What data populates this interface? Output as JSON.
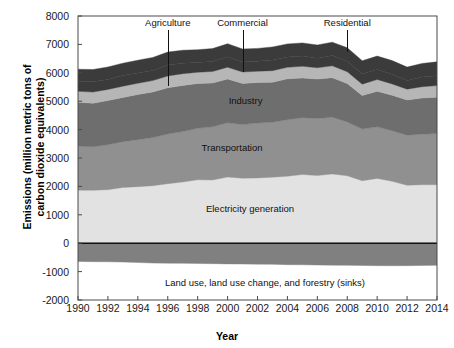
{
  "chart_data": {
    "type": "area",
    "stacked": true,
    "title": "",
    "xlabel": "Year",
    "ylabel": "Emissions (million metric tons of\ncarbon dioxide equivalents)",
    "xlim": [
      1990,
      2014
    ],
    "ylim": [
      -2000,
      8000
    ],
    "yticks": [
      8000,
      7000,
      6000,
      5000,
      4000,
      3000,
      2000,
      1000,
      0,
      -1000,
      -2000
    ],
    "xticks": [
      1990,
      1992,
      1994,
      1996,
      1998,
      2000,
      2002,
      2004,
      2006,
      2008,
      2010,
      2012,
      2014
    ],
    "xtick_labels": [
      "1990",
      "1992",
      "1994",
      "1996",
      "1998",
      "2000",
      "2002",
      "2004",
      "2006",
      "2008",
      "2010",
      "2012",
      "2014"
    ],
    "ytick_labels": [
      "8000",
      "7000",
      "6000",
      "5000",
      "4000",
      "3000",
      "2000",
      "1000",
      "0",
      "-1000",
      "-2000"
    ],
    "grid": false,
    "legend_position": "in-plot-annotations",
    "x": [
      1990,
      1991,
      1992,
      1993,
      1994,
      1995,
      1996,
      1997,
      1998,
      1999,
      2000,
      2001,
      2002,
      2003,
      2004,
      2005,
      2006,
      2007,
      2008,
      2009,
      2010,
      2011,
      2012,
      2013,
      2014
    ],
    "series": [
      {
        "name": "Electricity generation",
        "color": "#e2e2e2",
        "values": [
          1866,
          1862,
          1885,
          1961,
          1991,
          2024,
          2097,
          2155,
          2232,
          2227,
          2328,
          2287,
          2298,
          2325,
          2358,
          2418,
          2383,
          2438,
          2373,
          2200,
          2279,
          2180,
          2040,
          2060,
          2060
        ]
      },
      {
        "name": "Transportation",
        "color": "#909090",
        "values": [
          1548,
          1536,
          1581,
          1614,
          1656,
          1695,
          1746,
          1778,
          1817,
          1871,
          1913,
          1890,
          1931,
          1930,
          1990,
          2000,
          2007,
          2001,
          1896,
          1820,
          1820,
          1780,
          1765,
          1780,
          1800
        ]
      },
      {
        "name": "Industry",
        "color": "#6e6e6e",
        "values": [
          1550,
          1530,
          1559,
          1555,
          1589,
          1607,
          1630,
          1623,
          1570,
          1545,
          1540,
          1450,
          1430,
          1410,
          1440,
          1400,
          1390,
          1390,
          1350,
          1180,
          1250,
          1250,
          1240,
          1270,
          1280
        ]
      },
      {
        "name": "Commercial",
        "color": "#b6b6b6",
        "values": [
          385,
          393,
          390,
          399,
          398,
          400,
          415,
          413,
          400,
          405,
          415,
          402,
          396,
          410,
          405,
          410,
          400,
          415,
          418,
          400,
          415,
          400,
          380,
          400,
          410
        ]
      },
      {
        "name": "Residential",
        "color": "#3b3b3b",
        "values": [
          345,
          360,
          350,
          373,
          360,
          357,
          385,
          365,
          340,
          350,
          370,
          355,
          355,
          380,
          365,
          360,
          335,
          365,
          370,
          355,
          350,
          340,
          305,
          340,
          350
        ]
      },
      {
        "name": "Agriculture",
        "color": "#3b3b3b",
        "values": [
          432,
          435,
          440,
          438,
          450,
          460,
          455,
          462,
          455,
          455,
          460,
          455,
          450,
          455,
          460,
          465,
          465,
          470,
          475,
          470,
          475,
          480,
          470,
          480,
          485
        ]
      },
      {
        "name": "Land use, land use change, and forestry (sinks)",
        "color": "#808080",
        "values": [
          -640,
          -650,
          -655,
          -665,
          -680,
          -700,
          -705,
          -710,
          -715,
          -720,
          -730,
          -735,
          -740,
          -745,
          -755,
          -760,
          -770,
          -775,
          -780,
          -785,
          -790,
          -795,
          -790,
          -785,
          -780
        ]
      }
    ],
    "annotations": [
      {
        "name": "Agriculture",
        "label": "Agriculture",
        "x": 1996,
        "leader": true
      },
      {
        "name": "Commercial",
        "label": "Commercial",
        "x": 2001,
        "leader": true
      },
      {
        "name": "Residential",
        "label": "Residential",
        "x": 2008,
        "leader": true
      },
      {
        "name": "Industry",
        "label": "Industry",
        "x": 2001.2,
        "y": 5050,
        "leader": false
      },
      {
        "name": "Transportation",
        "label": "Transportation",
        "x": 2000.3,
        "y": 3400,
        "leader": false
      },
      {
        "name": "Electricity generation",
        "label": "Electricity generation",
        "x": 2001.5,
        "y": 1250,
        "leader": false
      },
      {
        "name": "Land use sinks",
        "label": "Land use, land use change, and forestry (sinks)",
        "x": 2002.5,
        "y": -1350,
        "leader": false
      }
    ]
  },
  "axis": {
    "ylabel_line1": "Emissions (million metric tons of",
    "ylabel_line2": "carbon dioxide equivalents)",
    "ylabel_full": "Emissions (million metric tons of\ncarbon dioxide equivalents)",
    "xlabel": "Year"
  },
  "labels": {
    "agriculture": "Agriculture",
    "commercial": "Commercial",
    "residential": "Residential",
    "industry": "Industry",
    "transportation": "Transportation",
    "electricity": "Electricity generation",
    "sinks": "Land use, land use change, and forestry (sinks)"
  },
  "colors": {
    "electricity": "#e2e2e2",
    "transportation": "#909090",
    "industry": "#6e6e6e",
    "commercial": "#b6b6b6",
    "residential": "#3b3b3b",
    "agriculture": "#3b3b3b",
    "sinks": "#808080",
    "axis": "#4a4a4a",
    "text": "#1a1a1a",
    "background": "#ffffff"
  }
}
